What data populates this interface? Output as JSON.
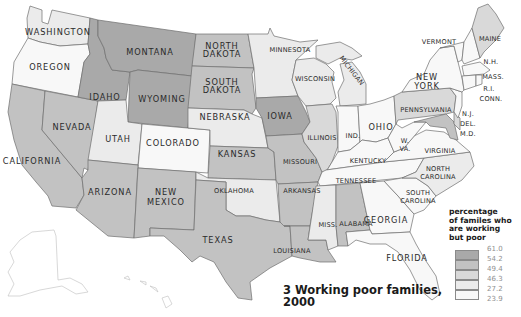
{
  "title": {
    "line1": "3 Working poor families,",
    "line2": "2000"
  },
  "legend": {
    "title_lines": [
      "percentage",
      "of familes who",
      "are working",
      "but poor"
    ],
    "breaks": [
      "61.0",
      "54.2",
      "49.4",
      "46.3",
      "27.2",
      "23.9"
    ],
    "bins": [
      {
        "range": "54.2–61.0",
        "color": "#a9a9a9"
      },
      {
        "range": "49.4–54.2",
        "color": "#c2c2c2"
      },
      {
        "range": "46.3–49.4",
        "color": "#d9d9d9"
      },
      {
        "range": "27.2–46.3",
        "color": "#ebebeb"
      },
      {
        "range": "23.9–27.2",
        "color": "#f8f8f8"
      }
    ]
  },
  "states": {
    "washington": {
      "label": "WASHINGTON",
      "bin": 3
    },
    "oregon": {
      "label": "OREGON",
      "bin": 4
    },
    "california": {
      "label": "CALIFORNIA",
      "bin": 1
    },
    "nevada": {
      "label": "NEVADA",
      "bin": 1
    },
    "idaho": {
      "label": "IDAHO",
      "bin": 0
    },
    "montana": {
      "label": "MONTANA",
      "bin": 0
    },
    "wyoming": {
      "label": "WYOMING",
      "bin": 0
    },
    "utah": {
      "label": "UTAH",
      "bin": 3
    },
    "colorado": {
      "label": "COLORADO",
      "bin": 4
    },
    "arizona": {
      "label": "ARIZONA",
      "bin": 1
    },
    "new_mexico": {
      "label": "NEW MEXICO",
      "bin": 1
    },
    "north_dakota": {
      "label": "NORTH DAKOTA",
      "bin": 1
    },
    "south_dakota": {
      "label": "SOUTH DAKOTA",
      "bin": 1
    },
    "nebraska": {
      "label": "NEBRASKA",
      "bin": 3
    },
    "kansas": {
      "label": "KANSAS",
      "bin": 1
    },
    "oklahoma": {
      "label": "OKLAHOMA",
      "bin": 3
    },
    "texas": {
      "label": "TEXAS",
      "bin": 1
    },
    "minnesota": {
      "label": "MINNESOTA",
      "bin": 3
    },
    "iowa": {
      "label": "IOWA",
      "bin": 0
    },
    "missouri": {
      "label": "MISSOURI",
      "bin": 1
    },
    "arkansas": {
      "label": "ARKANSAS",
      "bin": 1
    },
    "louisiana": {
      "label": "LOUISIANA",
      "bin": 1
    },
    "wisconsin": {
      "label": "WISCONSIN",
      "bin": 3
    },
    "illinois": {
      "label": "ILLINOIS",
      "bin": 2
    },
    "michigan": {
      "label": "MICHIGAN",
      "bin": 3
    },
    "indiana": {
      "label": "IND.",
      "bin": 4
    },
    "ohio": {
      "label": "OHIO",
      "bin": 4
    },
    "kentucky": {
      "label": "KENTUCKY",
      "bin": 4
    },
    "tennessee": {
      "label": "TENNESSEE",
      "bin": 4
    },
    "mississippi": {
      "label": "MISS.",
      "bin": 3
    },
    "alabama": {
      "label": "ALABAMA",
      "bin": 1
    },
    "georgia": {
      "label": "GEORGIA",
      "bin": 4
    },
    "florida": {
      "label": "FLORIDA",
      "bin": 4
    },
    "south_carolina": {
      "label": "SOUTH CAROLINA",
      "bin": 4
    },
    "north_carolina": {
      "label": "NORTH CAROLINA",
      "bin": 3
    },
    "virginia": {
      "label": "VIRGINIA",
      "bin": 4
    },
    "west_virginia": {
      "label": "W. VA.",
      "bin": 4
    },
    "pennsylvania": {
      "label": "PENNSYLVANIA",
      "bin": 2
    },
    "new_york": {
      "label": "NEW YORK",
      "bin": 4
    },
    "vermont": {
      "label": "VERMONT",
      "bin": 4
    },
    "new_hampshire": {
      "label": "N.H.",
      "bin": 4
    },
    "maine": {
      "label": "MAINE",
      "bin": 2
    },
    "massachusetts": {
      "label": "MASS.",
      "bin": 4
    },
    "rhode_island": {
      "label": "R.I.",
      "bin": 4
    },
    "connecticut": {
      "label": "CONN.",
      "bin": 4
    },
    "new_jersey": {
      "label": "N.J.",
      "bin": 4
    },
    "delaware": {
      "label": "DEL.",
      "bin": 2
    },
    "maryland": {
      "label": "M.D.",
      "bin": 1
    },
    "alaska": {
      "label": "",
      "bin": 4
    },
    "hawaii": {
      "label": "",
      "bin": 4
    }
  },
  "label_lines": {
    "north_dakota": [
      "NORTH",
      "DAKOTA"
    ],
    "south_dakota": [
      "SOUTH",
      "DAKOTA"
    ],
    "new_mexico": [
      "NEW",
      "MEXICO"
    ],
    "new_york": [
      "NEW",
      "YORK"
    ],
    "north_carolina": [
      "NORTH",
      "CAROLINA"
    ],
    "south_carolina": [
      "SOUTH",
      "CAROLINA"
    ],
    "west_virginia": [
      "W.",
      "VA."
    ]
  }
}
